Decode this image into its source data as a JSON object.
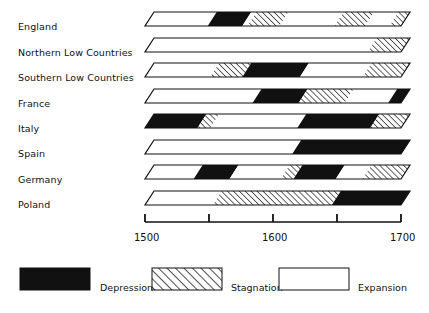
{
  "chart_data": {
    "type": "bar",
    "title": "",
    "subtitle": "",
    "xlabel": "",
    "ylabel": "",
    "orientation": "horizontal-timeline",
    "xlim": [
      1500,
      1700
    ],
    "x_ticks": [
      1500,
      1550,
      1600,
      1650,
      1700
    ],
    "x_tick_labels": [
      "1500",
      "",
      "1600",
      "",
      "1700"
    ],
    "grid": false,
    "legend_position": "bottom",
    "categories": [
      "England",
      "Northern Low Countries",
      "Southern Low Countries",
      "France",
      "Italy",
      "Spain",
      "Germany",
      "Poland"
    ],
    "phase_types": [
      "Depression",
      "Stagnation",
      "Expansion"
    ],
    "series": [
      {
        "name": "England",
        "segments": [
          {
            "phase": "Expansion",
            "start": 1500,
            "end": 1549
          },
          {
            "phase": "Depression",
            "start": 1549,
            "end": 1576
          },
          {
            "phase": "Expansion",
            "start": 1576,
            "end": 1580
          },
          {
            "phase": "Stagnation",
            "start": 1580,
            "end": 1605
          },
          {
            "phase": "Expansion",
            "start": 1605,
            "end": 1648
          },
          {
            "phase": "Stagnation",
            "start": 1648,
            "end": 1672
          },
          {
            "phase": "Expansion",
            "start": 1672,
            "end": 1691
          },
          {
            "phase": "Stagnation",
            "start": 1691,
            "end": 1700
          }
        ]
      },
      {
        "name": "Northern Low Countries",
        "segments": [
          {
            "phase": "Expansion",
            "start": 1500,
            "end": 1674
          },
          {
            "phase": "Stagnation",
            "start": 1674,
            "end": 1700
          }
        ]
      },
      {
        "name": "Southern Low Countries",
        "segments": [
          {
            "phase": "Expansion",
            "start": 1500,
            "end": 1551
          },
          {
            "phase": "Stagnation",
            "start": 1551,
            "end": 1576
          },
          {
            "phase": "Depression",
            "start": 1576,
            "end": 1621
          },
          {
            "phase": "Expansion",
            "start": 1621,
            "end": 1670
          },
          {
            "phase": "Stagnation",
            "start": 1670,
            "end": 1700
          }
        ]
      },
      {
        "name": "France",
        "segments": [
          {
            "phase": "Expansion",
            "start": 1500,
            "end": 1584
          },
          {
            "phase": "Depression",
            "start": 1584,
            "end": 1620
          },
          {
            "phase": "Stagnation",
            "start": 1620,
            "end": 1656
          },
          {
            "phase": "Expansion",
            "start": 1656,
            "end": 1690
          },
          {
            "phase": "Depression",
            "start": 1690,
            "end": 1700
          }
        ]
      },
      {
        "name": "Italy",
        "segments": [
          {
            "phase": "Depression",
            "start": 1500,
            "end": 1541
          },
          {
            "phase": "Stagnation",
            "start": 1541,
            "end": 1551
          },
          {
            "phase": "Expansion",
            "start": 1551,
            "end": 1619
          },
          {
            "phase": "Depression",
            "start": 1619,
            "end": 1676
          },
          {
            "phase": "Stagnation",
            "start": 1676,
            "end": 1700
          }
        ]
      },
      {
        "name": "Spain",
        "segments": [
          {
            "phase": "Expansion",
            "start": 1500,
            "end": 1615
          },
          {
            "phase": "Depression",
            "start": 1615,
            "end": 1700
          }
        ]
      },
      {
        "name": "Germany",
        "segments": [
          {
            "phase": "Expansion",
            "start": 1500,
            "end": 1538
          },
          {
            "phase": "Depression",
            "start": 1538,
            "end": 1566
          },
          {
            "phase": "Expansion",
            "start": 1566,
            "end": 1606
          },
          {
            "phase": "Stagnation",
            "start": 1606,
            "end": 1616
          },
          {
            "phase": "Depression",
            "start": 1616,
            "end": 1649
          },
          {
            "phase": "Expansion",
            "start": 1649,
            "end": 1670
          },
          {
            "phase": "Stagnation",
            "start": 1670,
            "end": 1700
          }
        ]
      },
      {
        "name": "Poland",
        "segments": [
          {
            "phase": "Expansion",
            "start": 1500,
            "end": 1553
          },
          {
            "phase": "Stagnation",
            "start": 1553,
            "end": 1646
          },
          {
            "phase": "Depression",
            "start": 1646,
            "end": 1700
          }
        ]
      }
    ],
    "colors": {
      "depression": "#111111",
      "stagnation_stroke": "#111111",
      "expansion": "#ffffff",
      "outline": "#111111",
      "text": "#111111"
    }
  },
  "axis": {
    "ticks": [
      {
        "value": 1500,
        "label": "1500"
      },
      {
        "value": 1550,
        "label": ""
      },
      {
        "value": 1600,
        "label": "1600"
      },
      {
        "value": 1650,
        "label": ""
      },
      {
        "value": 1700,
        "label": "1700"
      }
    ],
    "start_label": "1500",
    "mid_label": "1600",
    "end_label": "1700"
  },
  "legend": {
    "items": [
      {
        "key": "depression",
        "label": "Depression"
      },
      {
        "key": "stagnation",
        "label": "Stagnation"
      },
      {
        "key": "expansion",
        "label": "Expansion"
      }
    ]
  },
  "row_labels": [
    "England",
    "Northern Low Countries",
    "Southern Low Countries",
    "France",
    "Italy",
    "Spain",
    "Germany",
    "Poland"
  ]
}
